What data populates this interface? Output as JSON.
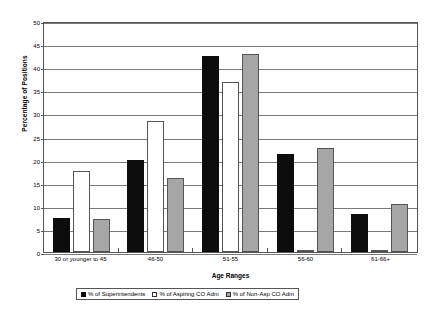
{
  "chart_data": {
    "type": "bar",
    "title": "",
    "xlabel": "Age Ranges",
    "ylabel": "Percentage of Positions",
    "categories": [
      "30 or younger to 45",
      "46-50",
      "51-55",
      "56-60",
      "61-66+"
    ],
    "series": [
      {
        "name": "% of Superintendents",
        "color": "#0d0d0d",
        "values": [
          7.4,
          20.1,
          42.8,
          21.3,
          8.2
        ]
      },
      {
        "name": "% of Aspiring CO Adm",
        "color": "#ffffff",
        "values": [
          17.7,
          28.6,
          37.2,
          0.0,
          0.3
        ]
      },
      {
        "name": "% of Non-Asp CO Adm",
        "color": "#a6a6a6",
        "values": [
          7.1,
          16.2,
          43.3,
          22.7,
          10.5
        ]
      }
    ],
    "ylim": [
      0,
      50
    ],
    "yticks": [
      0,
      5,
      10,
      15,
      20,
      25,
      30,
      35,
      40,
      45,
      50
    ],
    "ytick_labels": [
      "0",
      "5",
      "10",
      "15",
      "20",
      "25",
      "30",
      "35",
      "40",
      "45",
      "50"
    ],
    "grid": true,
    "legend_position": "bottom"
  },
  "legend": {
    "items": [
      {
        "label": "% of Superintendents",
        "swatch": "black-square-swatch"
      },
      {
        "label": "% of Aspiring CO Adm",
        "swatch": "white-square-swatch"
      },
      {
        "label": "% of Non-Asp CO Adm",
        "swatch": "gray-square-swatch"
      }
    ]
  },
  "axes": {
    "x_title": "Age Ranges",
    "y_title": "Percentage of Positions"
  }
}
